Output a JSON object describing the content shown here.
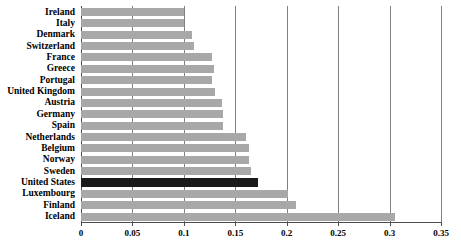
{
  "chart_data": {
    "type": "bar",
    "orientation": "horizontal",
    "title": "",
    "xlabel": "",
    "ylabel": "",
    "xlim": [
      0,
      0.35
    ],
    "xticks": [
      "0",
      "0.05",
      "0.1",
      "0.15",
      "0.2",
      "0.25",
      "0.3",
      "0.35"
    ],
    "xtick_values": [
      0,
      0.05,
      0.1,
      0.15,
      0.2,
      0.25,
      0.3,
      0.35
    ],
    "grid": "vertical",
    "legend": "none",
    "categories": [
      "Ireland",
      "Italy",
      "Denmark",
      "Switzerland",
      "France",
      "Greece",
      "Portugal",
      "United Kingdom",
      "Austria",
      "Germany",
      "Spain",
      "Netherlands",
      "Belgium",
      "Norway",
      "Sweden",
      "United States",
      "Luxembourg",
      "Finland",
      "Iceland"
    ],
    "values": [
      0.1,
      0.1,
      0.108,
      0.11,
      0.127,
      0.129,
      0.127,
      0.13,
      0.137,
      0.138,
      0.138,
      0.16,
      0.163,
      0.163,
      0.165,
      0.172,
      0.201,
      0.209,
      0.305
    ],
    "highlight_category": "United States",
    "colors": {
      "bar": "#a8a8a8",
      "highlight_bar": "#1a1a1a",
      "gridline": "#808080",
      "axis": "#4d4d4d",
      "background": "#ffffff",
      "text": "#000000"
    }
  }
}
